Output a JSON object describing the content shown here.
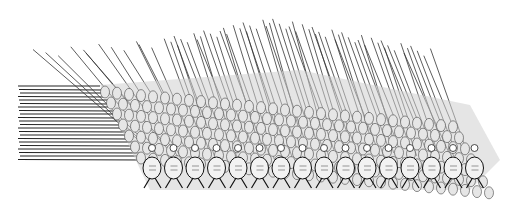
{
  "image": {
    "description": "Black-and-white engraving of a Macedonian phalanx marching right with long sarissa spears: front ranks level spears horizontally to the left, rear ranks hold spears raised diagonally upward",
    "background_color": "#ffffff",
    "ink_color": "#1a1a1a",
    "soldiers_front_rank_count": 16
  }
}
